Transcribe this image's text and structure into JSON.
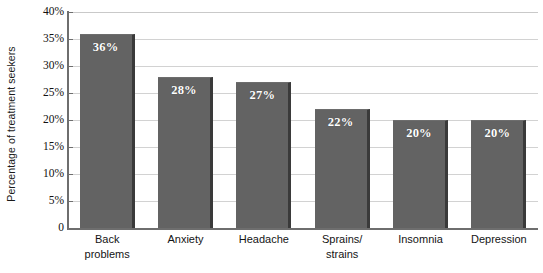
{
  "chart_data": {
    "type": "bar",
    "title": "",
    "subtitle": "",
    "xlabel": "",
    "ylabel": "Percentage of treatment seekers",
    "categories": [
      "Back problems",
      "Anxiety",
      "Headache",
      "Sprains/ strains",
      "Insomnia",
      "Depression"
    ],
    "category_lines": [
      [
        "Back",
        "problems"
      ],
      [
        "Anxiety",
        ""
      ],
      [
        "Headache",
        ""
      ],
      [
        "Sprains/",
        "strains"
      ],
      [
        "Insomnia",
        ""
      ],
      [
        "Depression",
        ""
      ]
    ],
    "values": [
      36,
      28,
      27,
      22,
      20,
      20
    ],
    "value_labels": [
      "36%",
      "28%",
      "27%",
      "22%",
      "20%",
      "20%"
    ],
    "ylim": [
      0,
      40
    ],
    "ytick_values": [
      0,
      5,
      10,
      15,
      20,
      25,
      30,
      35,
      40
    ],
    "ytick_labels": [
      "0",
      "5%",
      "10%",
      "15%",
      "20%",
      "25%",
      "30%",
      "35%",
      "40%"
    ],
    "grid": "horizontal",
    "legend": "none",
    "colors": {
      "bar_fill": "#636363",
      "bar_shadow": "#3a3a3a",
      "gridline": "#d2d2d2",
      "axis": "#6e6e6e",
      "value_label_text": "#ffffff",
      "tick_label_text": "#111111",
      "category_label_text": "#141414",
      "background": "#ffffff"
    }
  }
}
